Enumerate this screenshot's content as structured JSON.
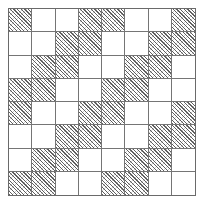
{
  "figure": {
    "rows": 8,
    "columns": 8,
    "cell_states": [
      "shaded",
      "white"
    ]
  },
  "colors": {
    "background": "#ffffff",
    "grid_line": "#757575",
    "outer_border": "#6a6a6a",
    "hatch_stroke": "#5f5f5f",
    "empty_cell": "#ffffff"
  },
  "chart_data": {
    "type": "heatmap",
    "title": "",
    "xlabel": "",
    "ylabel": "",
    "rows": 8,
    "columns": 8,
    "legend": [
      {
        "key": 1,
        "label": "shaded",
        "pattern": "diagonal-hatch"
      },
      {
        "key": 0,
        "label": "white",
        "pattern": "none"
      }
    ],
    "values": [
      [
        1,
        0,
        0,
        1,
        1,
        0,
        0,
        1
      ],
      [
        0,
        0,
        1,
        1,
        0,
        0,
        1,
        1
      ],
      [
        0,
        1,
        1,
        0,
        0,
        1,
        1,
        0
      ],
      [
        1,
        1,
        0,
        0,
        1,
        1,
        0,
        0
      ],
      [
        1,
        0,
        0,
        1,
        1,
        0,
        0,
        1
      ],
      [
        0,
        0,
        1,
        1,
        0,
        0,
        1,
        1
      ],
      [
        0,
        1,
        1,
        0,
        0,
        1,
        1,
        0
      ],
      [
        1,
        1,
        0,
        0,
        1,
        1,
        0,
        0
      ]
    ]
  }
}
